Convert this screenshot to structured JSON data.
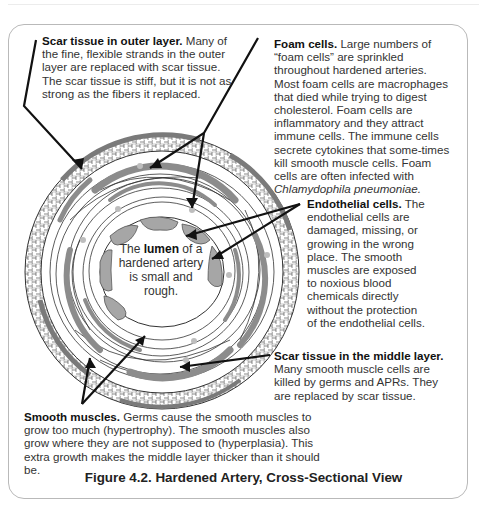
{
  "figure": {
    "caption": "Figure 4.2. Hardened Artery, Cross-Sectional View"
  },
  "lumen_label": {
    "prefix": "The ",
    "bold": "lumen",
    "rest": "of a hardened artery is small and rough."
  },
  "notes": {
    "outer_scar": {
      "title": "Scar tissue in outer layer.",
      "body": "Many of the fine, flexible strands in the outer layer are replaced with scar tissue. The scar tissue is stiff, but it is not as strong as the fibers it replaced."
    },
    "foam_cells": {
      "title": "Foam cells.",
      "body": "Large numbers of “foam cells” are sprinkled throughout hardened arteries. Most foam cells are macrophages that died while trying to digest cholesterol. Foam cells are inflammatory and they attract immune cells. The immune cells secrete cytokines that some-times kill smooth muscle cells. Foam cells are often infected with",
      "organism": "Chlamydophila pneumoniae."
    },
    "endothelial": {
      "title": "Endothelial cells.",
      "body": "The endothelial cells are damaged, missing, or growing in the wrong place. The smooth muscles are exposed to noxious blood chemicals directly without the protection of the endothelial cells."
    },
    "middle_scar": {
      "title": "Scar tissue in the middle layer.",
      "body": "Many smooth muscle cells are killed by germs and APRs. They are replaced by scar tissue."
    },
    "smooth_muscles": {
      "title": "Smooth muscles.",
      "body": "Germs cause the smooth muscles to grow too much (hypertrophy). The smooth muscles also grow where they are not supposed to (hyperplasia). This extra growth makes the middle layer thicker than it should be."
    }
  },
  "colors": {
    "outer_layer_pattern": "#d9d9d9",
    "smooth_muscle_band": "#8c8c8c",
    "endothelial_cell": "#a6a6a6",
    "foam_cell": "#bdbdbd",
    "lines": "#111111"
  }
}
